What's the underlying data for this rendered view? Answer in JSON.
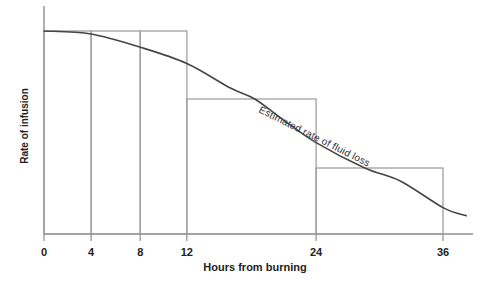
{
  "chart_data": {
    "type": "bar+line",
    "title": "",
    "xlabel": "Hours from burning",
    "ylabel": "Rate of infusion",
    "curve_label": "Estimated rate of fluid loss",
    "x_ticks": [
      0,
      4,
      8,
      12,
      24,
      36
    ],
    "x_tick_labels": [
      "0",
      "4",
      "8",
      "12",
      "24",
      "36"
    ],
    "x_unit": "hours",
    "y_ticks": [],
    "y_unit": "relative rate (unlabeled axis), 100 = initial rate",
    "ylim": [
      0,
      100
    ],
    "grid": false,
    "legend": "none (curve labeled inline along its slope)",
    "bars": [
      {
        "x_start": 0,
        "x_end": 4,
        "height": 100
      },
      {
        "x_start": 4,
        "x_end": 8,
        "height": 100
      },
      {
        "x_start": 8,
        "x_end": 12,
        "height": 100
      },
      {
        "x_start": 12,
        "x_end": 24,
        "height": 66.5
      },
      {
        "x_start": 24,
        "x_end": 36,
        "height": 32.5
      }
    ],
    "curve_points": [
      [
        0,
        100
      ],
      [
        4,
        98.5
      ],
      [
        8,
        92
      ],
      [
        12,
        84
      ],
      [
        16,
        72
      ],
      [
        18.3,
        66.5
      ],
      [
        21,
        56
      ],
      [
        24,
        45
      ],
      [
        28.6,
        32.5
      ],
      [
        32,
        26
      ],
      [
        36,
        13
      ],
      [
        38.2,
        9
      ]
    ],
    "colors": {
      "background": "#ffffff",
      "axis": "#8e8e8e",
      "bars": "#a0a0a0",
      "curve": "#454545",
      "text": "#222222"
    },
    "layout": {
      "left": 44,
      "right": 443,
      "bottom": 234,
      "top": 31,
      "axis_top_y": 6,
      "axis_right_end": 473,
      "tick_length": 7,
      "tick_label_baseline": 256,
      "tick_fractions": [
        0,
        0.118,
        0.241,
        0.358,
        0.682,
        1.0
      ],
      "curve_label_angle_deg": 26.5,
      "curve_label_x": 258,
      "curve_label_y": 112
    }
  }
}
